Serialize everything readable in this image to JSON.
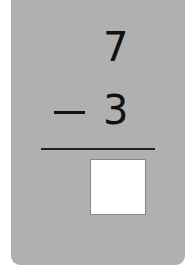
{
  "problem": {
    "minuend": "7",
    "subtrahend": "3",
    "operator": "minus",
    "answer": ""
  },
  "colors": {
    "card_background": "#b0b0b0",
    "answer_box": "#ffffff",
    "text": "#111111"
  }
}
